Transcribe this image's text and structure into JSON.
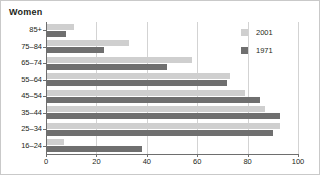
{
  "chart_data": {
    "type": "bar",
    "orientation": "horizontal",
    "title": "Women",
    "xlabel": "",
    "ylabel": "",
    "xlim": [
      0,
      100
    ],
    "xticks": [
      0,
      20,
      40,
      60,
      80,
      100
    ],
    "grid": true,
    "legend_position": "top-right",
    "categories": [
      "85+",
      "75–84",
      "65–74",
      "55–64",
      "45–54",
      "35–44",
      "25–34",
      "16–24"
    ],
    "series": [
      {
        "name": "2001",
        "color": "#cfcfcf",
        "values": [
          11,
          33,
          58,
          73,
          79,
          87,
          93,
          7
        ]
      },
      {
        "name": "1971",
        "color": "#6f6f6f",
        "values": [
          8,
          23,
          48,
          72,
          85,
          93,
          90,
          38
        ]
      }
    ]
  },
  "legend": {
    "items": [
      {
        "label": "2001",
        "color": "#cfcfcf"
      },
      {
        "label": "1971",
        "color": "#6f6f6f"
      }
    ]
  },
  "colors": {
    "series_2001": "#cfcfcf",
    "series_1971": "#6f6f6f",
    "axis": "#6e6e6e",
    "grid": "#d3d3d3",
    "frame": "#c9c9c9",
    "text": "#231f20"
  }
}
